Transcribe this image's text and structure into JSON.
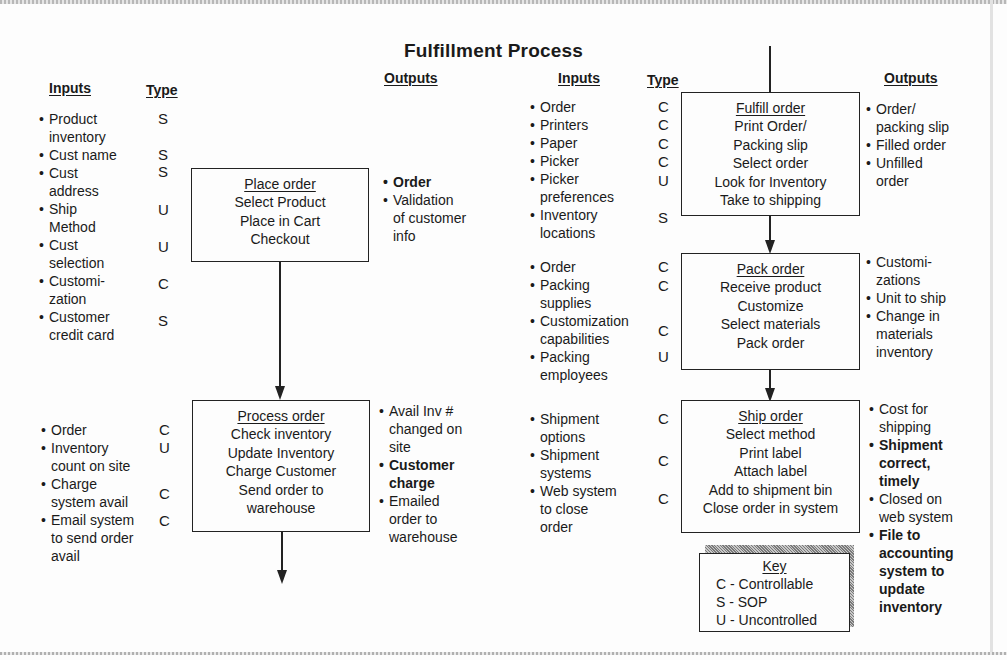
{
  "title": "Fulfillment Process",
  "key": {
    "title": "Key",
    "entries": [
      "C - Controllable",
      "S - SOP",
      "U - Uncontrolled"
    ]
  },
  "headers": {
    "inputs": "Inputs",
    "type": "Type",
    "outputs": "Outputs"
  },
  "steps": [
    {
      "id": "place-order",
      "title": "Place order",
      "actions": [
        "Select Product",
        "Place in Cart",
        "Checkout"
      ],
      "inputs": [
        {
          "label": "Product inventory",
          "lines": [
            "Product",
            "inventory"
          ],
          "type": "S"
        },
        {
          "label": "Cust name",
          "lines": [
            "Cust name"
          ],
          "type": "S"
        },
        {
          "label": "Cust address",
          "lines": [
            "Cust",
            "address"
          ],
          "type": "S"
        },
        {
          "label": "Ship Method",
          "lines": [
            "Ship",
            "Method"
          ],
          "type": "U"
        },
        {
          "label": "Cust selection",
          "lines": [
            "Cust",
            "selection"
          ],
          "type": "U"
        },
        {
          "label": "Customization",
          "lines": [
            "Customi-",
            "zation"
          ],
          "type": "C"
        },
        {
          "label": "Customer credit card",
          "lines": [
            "Customer",
            "credit card"
          ],
          "type": "S"
        }
      ],
      "outputs": [
        {
          "lines": [
            "Order"
          ],
          "bold": true
        },
        {
          "lines": [
            "Validation",
            "of customer",
            "info"
          ],
          "bold": false
        }
      ]
    },
    {
      "id": "process-order",
      "title": "Process order",
      "actions": [
        "Check inventory",
        "Update Inventory",
        "Charge Customer",
        "Send order to",
        "warehouse"
      ],
      "inputs": [
        {
          "label": "Order",
          "lines": [
            "Order"
          ],
          "type": "C"
        },
        {
          "label": "Inventory count on site",
          "lines": [
            "Inventory",
            "count on site"
          ],
          "type": "U"
        },
        {
          "label": "Charge system avail",
          "lines": [
            "Charge",
            "system avail"
          ],
          "type": "C"
        },
        {
          "label": "Email system to send order avail",
          "lines": [
            "Email system",
            "to send order",
            "avail"
          ],
          "type": "C"
        }
      ],
      "outputs": [
        {
          "lines": [
            "Avail Inv #",
            "changed on",
            "site"
          ],
          "bold": false
        },
        {
          "lines": [
            "Customer",
            "charge"
          ],
          "bold": true
        },
        {
          "lines": [
            "Emailed",
            "order to",
            "warehouse"
          ],
          "bold": false
        }
      ]
    },
    {
      "id": "fulfill-order",
      "title": "Fulfill order",
      "actions": [
        "Print Order/",
        "Packing slip",
        "Select order",
        "Look for Inventory",
        "Take to shipping"
      ],
      "inputs": [
        {
          "label": "Order",
          "lines": [
            "Order"
          ],
          "type": "C"
        },
        {
          "label": "Printers",
          "lines": [
            "Printers"
          ],
          "type": "C"
        },
        {
          "label": "Paper",
          "lines": [
            "Paper"
          ],
          "type": "C"
        },
        {
          "label": "Picker",
          "lines": [
            "Picker"
          ],
          "type": "C"
        },
        {
          "label": "Picker preferences",
          "lines": [
            "Picker",
            "preferences"
          ],
          "type": "U"
        },
        {
          "label": "Inventory locations",
          "lines": [
            "Inventory",
            "locations"
          ],
          "type": "S"
        }
      ],
      "outputs": [
        {
          "lines": [
            "Order/",
            "packing slip"
          ],
          "bold": false
        },
        {
          "lines": [
            "Filled order"
          ],
          "bold": false
        },
        {
          "lines": [
            "Unfilled",
            "order"
          ],
          "bold": false
        }
      ]
    },
    {
      "id": "pack-order",
      "title": "Pack order",
      "actions": [
        "Receive product",
        "Customize",
        "Select materials",
        "Pack order"
      ],
      "inputs": [
        {
          "label": "Order",
          "lines": [
            "Order"
          ],
          "type": "C"
        },
        {
          "label": "Packing supplies",
          "lines": [
            "Packing",
            "supplies"
          ],
          "type": "C"
        },
        {
          "label": "Customization capabilities",
          "lines": [
            "Customization",
            "capabilities"
          ],
          "type": "C"
        },
        {
          "label": "Packing employees",
          "lines": [
            "Packing",
            "employees"
          ],
          "type": "U"
        }
      ],
      "outputs": [
        {
          "lines": [
            "Customi-",
            "zations"
          ],
          "bold": false
        },
        {
          "lines": [
            "Unit to ship"
          ],
          "bold": false
        },
        {
          "lines": [
            "Change in",
            "materials",
            "inventory"
          ],
          "bold": false
        }
      ]
    },
    {
      "id": "ship-order",
      "title": "Ship order",
      "actions": [
        "Select method",
        "Print label",
        "Attach label",
        "Add to shipment bin",
        "Close order in system"
      ],
      "inputs": [
        {
          "label": "Shipment options",
          "lines": [
            "Shipment",
            "options"
          ],
          "type": "C"
        },
        {
          "label": "Shipment systems",
          "lines": [
            "Shipment",
            "systems"
          ],
          "type": "C"
        },
        {
          "label": "Web system to close order",
          "lines": [
            "Web system",
            "to close",
            "order"
          ],
          "type": "C"
        }
      ],
      "outputs": [
        {
          "lines": [
            "Cost for",
            "shipping"
          ],
          "bold": false
        },
        {
          "lines": [
            "Shipment",
            "correct,",
            "timely"
          ],
          "bold": true
        },
        {
          "lines": [
            "Closed on",
            "web system"
          ],
          "bold": false
        },
        {
          "lines": [
            "File to",
            "accounting",
            "system to",
            "update",
            "inventory"
          ],
          "bold": true
        }
      ]
    }
  ]
}
